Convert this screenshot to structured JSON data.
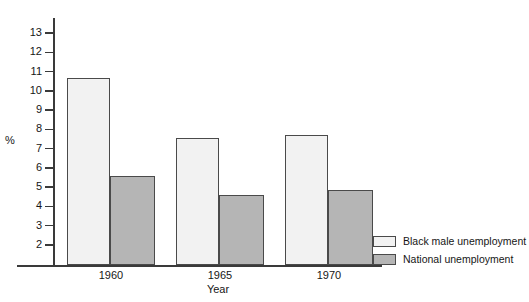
{
  "chart_data": {
    "type": "bar",
    "title": "",
    "xlabel": "Year",
    "ylabel": "%",
    "categories": [
      "1960",
      "1965",
      "1970"
    ],
    "series": [
      {
        "name": "Black male unemployment",
        "values": [
          10.65,
          7.55,
          7.7
        ],
        "color": "#f2f2f2"
      },
      {
        "name": "National unemployment",
        "values": [
          5.6,
          4.6,
          4.85
        ],
        "color": "#b5b5b5"
      }
    ],
    "ylim": [
      1.0,
      13.6
    ],
    "yticks": [
      2,
      3,
      4,
      5,
      6,
      7,
      8,
      9,
      10,
      11,
      12,
      13
    ],
    "ytick_labels": [
      "2",
      "3",
      "4",
      "5",
      "6",
      "7",
      "8",
      "9",
      "10",
      "11",
      "12",
      "13"
    ],
    "grid": false,
    "legend_position": "bottom-right"
  },
  "axes": {
    "y_title": "%",
    "x_title": "Year"
  },
  "legend": {
    "items": [
      {
        "label": "Black male unemployment",
        "swatch": "#f2f2f2"
      },
      {
        "label": "National unemployment",
        "swatch": "#b5b5b5"
      }
    ]
  }
}
